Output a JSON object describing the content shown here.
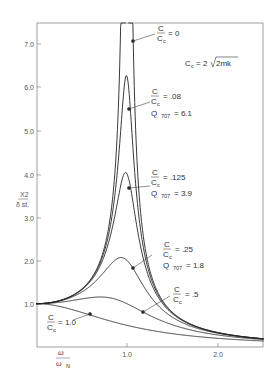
{
  "chart_data": {
    "type": "line",
    "title": "",
    "xlabel": "ω / ω_N",
    "ylabel": "X2 / δ st.",
    "xlim": [
      0,
      2.5
    ],
    "ylim": [
      0,
      7.5
    ],
    "grid": false,
    "x_ticks": [
      "1.0",
      "2.0"
    ],
    "y_ticks": [
      "1.0",
      "2.0",
      "3.0",
      "4.0",
      "5.0",
      "6.0",
      "7.0"
    ],
    "formula_note": "Cc = 2√(2mk)",
    "series": [
      {
        "name": "C/Cc = 0",
        "zeta": 0,
        "peak": "∞",
        "label_point": [
          1.01,
          7.05
        ]
      },
      {
        "name": "C/Cc = .08",
        "zeta": 0.08,
        "q707": "6.1",
        "peak": 6.2,
        "label_point": [
          1.0,
          5.5
        ]
      },
      {
        "name": "C/Cc = .125",
        "zeta": 0.125,
        "q707": "3.9",
        "peak": 4.0,
        "label_point": [
          1.0,
          3.7
        ]
      },
      {
        "name": "C/Cc = .25",
        "zeta": 0.25,
        "q707": "1.8",
        "peak": 2.05,
        "label_point": [
          1.07,
          1.8
        ]
      },
      {
        "name": "C/Cc = .5",
        "zeta": 0.5,
        "peak": 1.15,
        "label_point": [
          1.17,
          0.8
        ]
      },
      {
        "name": "C/Cc = 1.0",
        "zeta": 1.0,
        "peak": 1.0,
        "label_point": [
          0.63,
          0.74
        ]
      }
    ]
  },
  "labels": {
    "ratio_num": "C",
    "ratio_den": "C",
    "ratio_den_sub": "c",
    "z0": "= 0",
    "z08": "= .08",
    "z125": "= .125",
    "z25": "= .25",
    "z5": "= .5",
    "z1": "= 1.0",
    "q_prefix": "Q",
    "q_sub": "707",
    "q08": "= 6.1",
    "q125": "= 3.9",
    "q25": "= 1.8",
    "cc_formula_left": "C",
    "cc_formula_sub": "c",
    "cc_formula_eq": "= 2",
    "cc_formula_rad": "2mk",
    "ylabel_top": "X2",
    "ylabel_bottom": "δ st.",
    "xlabel_top": "ω",
    "xlabel_bottom": "ω",
    "xlabel_sub": "N"
  },
  "axes": {
    "y": [
      "7.0",
      "6.0",
      "5.0",
      "4.0",
      "3.0",
      "2.0",
      "1.0"
    ],
    "x": [
      "1.0",
      "2.0"
    ]
  }
}
